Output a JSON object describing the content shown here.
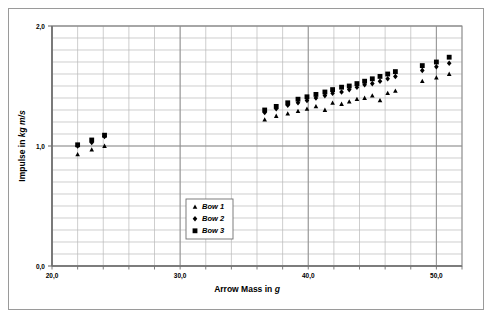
{
  "chart_data": {
    "type": "scatter",
    "title": "",
    "xlabel": "Arrow Mass in g",
    "xlabel_plain": "Arrow Mass in ",
    "xlabel_unit": "g",
    "ylabel": "Impulse in kg m/s",
    "ylabel_plain": "Impulse in ",
    "ylabel_unit": "kg m/s",
    "xlim": [
      20.0,
      52.0
    ],
    "ylim": [
      0.0,
      2.0
    ],
    "x_major_ticks": [
      "20,0",
      "30,0",
      "40,0",
      "50,0"
    ],
    "x_major_values": [
      20.0,
      30.0,
      40.0,
      50.0
    ],
    "x_minor_step": 2.0,
    "y_major_ticks": [
      "0,0",
      "1,0",
      "2,0"
    ],
    "y_major_values": [
      0.0,
      1.0,
      2.0
    ],
    "y_minor_step": 0.1,
    "grid": true,
    "legend_position": "inside-lower-left",
    "marker_color": "#000000",
    "grid_color": "#b9b9b9",
    "axis_color": "#808080",
    "series": [
      {
        "name": "Bow 1",
        "marker": "triangle",
        "points": [
          [
            22.0,
            0.93
          ],
          [
            23.1,
            0.97
          ],
          [
            24.1,
            1.0
          ],
          [
            36.6,
            1.22
          ],
          [
            37.5,
            1.25
          ],
          [
            38.4,
            1.27
          ],
          [
            39.2,
            1.29
          ],
          [
            39.9,
            1.31
          ],
          [
            40.6,
            1.33
          ],
          [
            41.3,
            1.3
          ],
          [
            41.9,
            1.36
          ],
          [
            42.6,
            1.35
          ],
          [
            43.2,
            1.37
          ],
          [
            43.8,
            1.39
          ],
          [
            44.4,
            1.4
          ],
          [
            45.0,
            1.42
          ],
          [
            45.6,
            1.38
          ],
          [
            46.2,
            1.44
          ],
          [
            46.8,
            1.46
          ],
          [
            48.9,
            1.54
          ],
          [
            50.0,
            1.57
          ],
          [
            51.0,
            1.6
          ]
        ]
      },
      {
        "name": "Bow 2",
        "marker": "diamond",
        "points": [
          [
            22.0,
            1.0
          ],
          [
            23.1,
            1.03
          ],
          [
            24.1,
            1.08
          ],
          [
            36.6,
            1.28
          ],
          [
            37.5,
            1.31
          ],
          [
            38.4,
            1.34
          ],
          [
            39.2,
            1.36
          ],
          [
            39.9,
            1.38
          ],
          [
            40.6,
            1.4
          ],
          [
            41.3,
            1.42
          ],
          [
            41.9,
            1.44
          ],
          [
            42.6,
            1.45
          ],
          [
            43.2,
            1.47
          ],
          [
            43.8,
            1.49
          ],
          [
            44.4,
            1.51
          ],
          [
            45.0,
            1.52
          ],
          [
            45.6,
            1.54
          ],
          [
            46.2,
            1.56
          ],
          [
            46.8,
            1.58
          ],
          [
            48.9,
            1.63
          ],
          [
            50.0,
            1.66
          ],
          [
            51.0,
            1.69
          ]
        ]
      },
      {
        "name": "Bow 3",
        "marker": "square",
        "points": [
          [
            22.0,
            1.01
          ],
          [
            23.1,
            1.05
          ],
          [
            24.1,
            1.09
          ],
          [
            36.6,
            1.3
          ],
          [
            37.5,
            1.33
          ],
          [
            38.4,
            1.36
          ],
          [
            39.2,
            1.39
          ],
          [
            39.9,
            1.41
          ],
          [
            40.6,
            1.43
          ],
          [
            41.3,
            1.45
          ],
          [
            41.9,
            1.47
          ],
          [
            42.6,
            1.49
          ],
          [
            43.2,
            1.5
          ],
          [
            43.8,
            1.52
          ],
          [
            44.4,
            1.54
          ],
          [
            45.0,
            1.56
          ],
          [
            45.6,
            1.58
          ],
          [
            46.2,
            1.6
          ],
          [
            46.8,
            1.62
          ],
          [
            48.9,
            1.67
          ],
          [
            50.0,
            1.7
          ],
          [
            51.0,
            1.74
          ]
        ]
      }
    ]
  },
  "legend": {
    "items": [
      {
        "label": "Bow 1",
        "marker": "triangle"
      },
      {
        "label": "Bow 2",
        "marker": "diamond"
      },
      {
        "label": "Bow 3",
        "marker": "square"
      }
    ]
  }
}
